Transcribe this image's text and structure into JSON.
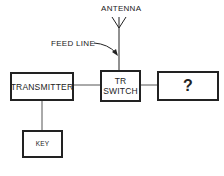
{
  "diagram": {
    "labels": {
      "antenna": "ANTENNA",
      "feed_line": "FEED LINE"
    },
    "blocks": {
      "transmitter": "TRANSMITTER",
      "tr_switch_line1": "TR",
      "tr_switch_line2": "SWITCH",
      "unknown": "?",
      "key": "KEY"
    },
    "connections": [
      {
        "from": "transmitter",
        "to": "tr_switch"
      },
      {
        "from": "tr_switch",
        "to": "unknown"
      },
      {
        "from": "transmitter",
        "to": "key"
      },
      {
        "from": "tr_switch",
        "to": "antenna",
        "via": "feed_line"
      }
    ],
    "colors": {
      "line": "#222222",
      "background": "#ffffff"
    }
  }
}
